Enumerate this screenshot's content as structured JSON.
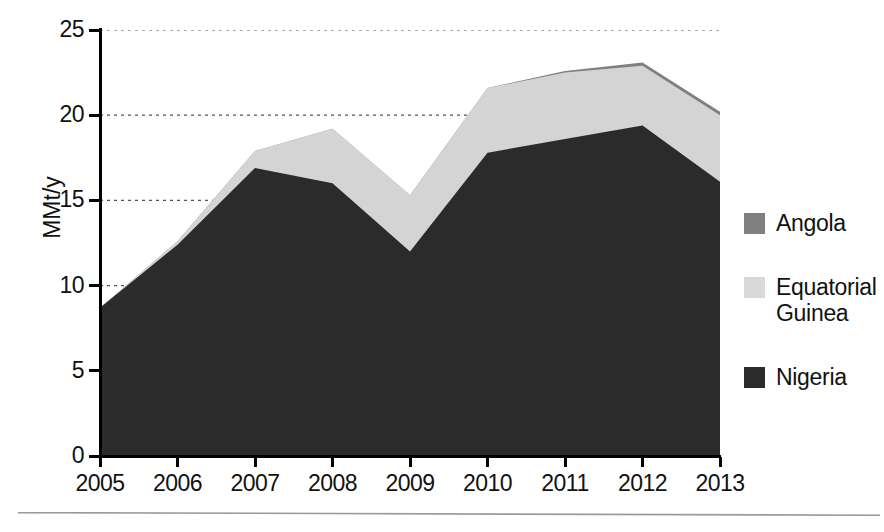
{
  "chart_data": {
    "type": "area",
    "stacked": true,
    "title": "",
    "xlabel": "",
    "ylabel": "MMt/y",
    "categories": [
      "2005",
      "2006",
      "2007",
      "2008",
      "2009",
      "2010",
      "2011",
      "2012",
      "2013"
    ],
    "x": [
      2005,
      2006,
      2007,
      2008,
      2009,
      2010,
      2011,
      2012,
      2013
    ],
    "xlim": [
      2005,
      2013
    ],
    "ylim": [
      0,
      25
    ],
    "ytick_labels": [
      "0",
      "5",
      "10",
      "15",
      "20",
      "25"
    ],
    "yticks": [
      0,
      5,
      10,
      15,
      20,
      25
    ],
    "grid": true,
    "grid_style": "dotted-horizontal",
    "legend_position": "right",
    "series": [
      {
        "name": "Nigeria",
        "color": "#2b2b2b",
        "values": [
          8.7,
          12.4,
          16.9,
          16.0,
          12.0,
          17.8,
          18.6,
          19.4,
          16.1
        ]
      },
      {
        "name": "Equatorial Guinea",
        "color": "#d4d4d4",
        "values": [
          0.0,
          0.2,
          1.0,
          3.2,
          3.3,
          3.8,
          3.9,
          3.5,
          3.9
        ]
      },
      {
        "name": "Angola",
        "color": "#808080",
        "values": [
          0.0,
          0.0,
          0.0,
          0.0,
          0.0,
          0.0,
          0.1,
          0.2,
          0.2
        ]
      }
    ],
    "cumulative_tops": {
      "nigeria": [
        8.7,
        12.4,
        16.9,
        16.0,
        12.0,
        17.8,
        18.6,
        19.4,
        16.1
      ],
      "equatorial_guinea": [
        8.7,
        12.6,
        17.9,
        19.2,
        15.3,
        21.6,
        22.5,
        22.9,
        20.0
      ],
      "angola": [
        8.7,
        12.6,
        17.9,
        19.2,
        15.3,
        21.6,
        22.6,
        23.1,
        20.2
      ]
    }
  },
  "axes": {
    "y_title": "MMt/y",
    "y_ticks": [
      {
        "value": 25,
        "label": "25"
      },
      {
        "value": 20,
        "label": "20"
      },
      {
        "value": 15,
        "label": "15"
      },
      {
        "value": 10,
        "label": "10"
      },
      {
        "value": 5,
        "label": "5"
      },
      {
        "value": 0,
        "label": "0"
      }
    ],
    "x_ticks": [
      {
        "value": 2005,
        "label": "2005"
      },
      {
        "value": 2006,
        "label": "2006"
      },
      {
        "value": 2007,
        "label": "2007"
      },
      {
        "value": 2008,
        "label": "2008"
      },
      {
        "value": 2009,
        "label": "2009"
      },
      {
        "value": 2010,
        "label": "2010"
      },
      {
        "value": 2011,
        "label": "2011"
      },
      {
        "value": 2012,
        "label": "2012"
      },
      {
        "value": 2013,
        "label": "2013"
      }
    ]
  },
  "legend": {
    "items": [
      {
        "label": "Angola",
        "color": "#808080"
      },
      {
        "label": "Equatorial Guinea",
        "color": "#d9d9d9"
      },
      {
        "label": "Nigeria",
        "color": "#2b2b2b"
      }
    ]
  },
  "colors": {
    "nigeria": "#2b2b2b",
    "equatorial_guinea": "#d4d4d4",
    "angola": "#808080",
    "axis": "#000000",
    "grid": "#555555",
    "background": "#ffffff"
  }
}
